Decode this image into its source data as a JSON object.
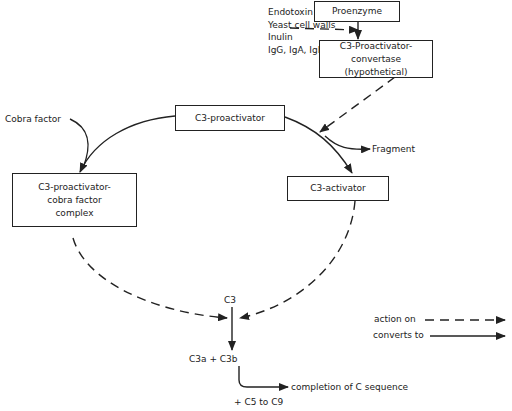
{
  "diagram": {
    "type": "flow",
    "boxes": {
      "proenzyme": "Proenzyme",
      "convertase_line1": "C3-Proactivator-",
      "convertase_line2": "convertase (hypothetical)",
      "proactivator": "C3-proactivator",
      "complex_line1": "C3-proactivator-",
      "complex_line2": "cobra factor",
      "complex_line3": "complex",
      "activator": "C3-activator"
    },
    "activators": [
      "Endotoxin",
      "Yeast cell walls",
      "Inulin",
      "IgG, IgA, IgE"
    ],
    "labels": {
      "cobra_factor": "Cobra factor",
      "fragment": "Fragment",
      "c3": "C3",
      "c3a_c3b": "C3a + C3b",
      "completion": "completion of C sequence",
      "c5_c9": "+ C5 to C9"
    },
    "legend": [
      {
        "label": "action on",
        "style": "dashed"
      },
      {
        "label": "converts to",
        "style": "solid"
      }
    ],
    "colors": {
      "line": "#222222",
      "background": "#ffffff"
    }
  }
}
